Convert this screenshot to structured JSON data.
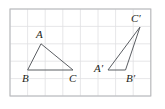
{
  "figure": {
    "background_color": "#ffffff",
    "grid": {
      "line_color": "#dfe0e2",
      "border_color": "#b9babd",
      "cell_size_px": 17.6,
      "columns": 8,
      "rows": 5,
      "x_lines": [
        10,
        27.6,
        45.2,
        62.8,
        80.4,
        98,
        115.6,
        133.2,
        150.8
      ],
      "y_lines": [
        9,
        26.4,
        43.8,
        61.2,
        78.6,
        96
      ],
      "frame": {
        "x": 10,
        "y": 9,
        "width": 140.8,
        "height": 87
      }
    },
    "stroke_color": "#5b5e63",
    "label_color": "#1d1e20",
    "shapes": [
      {
        "name": "triangle-abc",
        "vertices": [
          {
            "label": "A",
            "x": 41,
            "y": 43.8,
            "label_x": 36,
            "label_y": 38
          },
          {
            "label": "B",
            "x": 27.6,
            "y": 70,
            "label_x": 22,
            "label_y": 82
          },
          {
            "label": "C",
            "x": 73,
            "y": 70,
            "label_x": 69,
            "label_y": 82
          }
        ],
        "path": "M 41 43.8 L 27.6 70 L 73 70 Z"
      },
      {
        "name": "triangle-a-prime-b-prime-c-prime",
        "vertices": [
          {
            "label": "C′",
            "x": 140,
            "y": 27,
            "label_x": 132,
            "label_y": 22
          },
          {
            "label": "A′",
            "x": 108,
            "y": 70,
            "label_x": 95,
            "label_y": 72
          },
          {
            "label": "B′",
            "x": 125.5,
            "y": 70,
            "label_x": 127,
            "label_y": 82
          }
        ],
        "path": "M 140 27 L 108 70 L 125.5 70 Z"
      }
    ],
    "labels": [
      {
        "name": "label-a",
        "text": "A",
        "x": 36,
        "y": 38
      },
      {
        "name": "label-b",
        "text": "B",
        "x": 22,
        "y": 82
      },
      {
        "name": "label-c",
        "text": "C",
        "x": 69,
        "y": 82
      },
      {
        "name": "label-a-prime",
        "text": "A′",
        "x": 94,
        "y": 72
      },
      {
        "name": "label-b-prime",
        "text": "B′",
        "x": 126,
        "y": 82
      },
      {
        "name": "label-c-prime",
        "text": "C′",
        "x": 131,
        "y": 22
      }
    ]
  }
}
